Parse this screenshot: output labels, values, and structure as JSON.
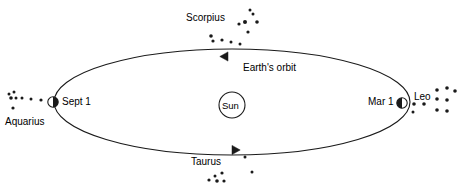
{
  "diagram": {
    "background_color": "#ffffff",
    "stroke_color": "#1a1a1a",
    "text_color": "#000000",
    "width": 466,
    "height": 191
  },
  "orbit": {
    "label": "Earth's orbit",
    "label_x": 243,
    "label_y": 63,
    "center_x": 232,
    "center_y": 102,
    "radius_x": 178,
    "radius_y": 53,
    "direction": "counterclockwise",
    "stroke_width": 1.1
  },
  "sun": {
    "label": "Sun",
    "center_x": 232,
    "center_y": 105,
    "radius": 13,
    "label_x": 222,
    "label_y": 101
  },
  "earth_positions": [
    {
      "name": "earth-sept-1",
      "date_label": "Sept 1",
      "marker_x": 53,
      "marker_y": 102,
      "marker_radius": 5.2,
      "label_x": 62,
      "label_y": 97,
      "lit_side": "right"
    },
    {
      "name": "earth-mar-1",
      "date_label": "Mar 1",
      "marker_x": 402,
      "marker_y": 103,
      "marker_radius": 5.2,
      "label_x": 368,
      "label_y": 97,
      "lit_side": "left"
    }
  ],
  "direction_arrows": [
    {
      "name": "arrow-top",
      "x": 228,
      "y": 56.5,
      "rotation": 180
    },
    {
      "name": "arrow-bottom",
      "x": 232,
      "y": 150,
      "rotation": 0
    }
  ],
  "constellations": [
    {
      "name": "scorpius",
      "label": "Scorpius",
      "label_x": 186,
      "label_y": 13,
      "stars": [
        {
          "x": 250,
          "y": 10,
          "r": 1.5
        },
        {
          "x": 253,
          "y": 14,
          "r": 1.5
        },
        {
          "x": 245,
          "y": 22,
          "r": 2.0
        },
        {
          "x": 257,
          "y": 22,
          "r": 1.8
        },
        {
          "x": 239,
          "y": 24,
          "r": 1.6
        },
        {
          "x": 248,
          "y": 32,
          "r": 1.6
        },
        {
          "x": 211,
          "y": 36,
          "r": 1.8
        },
        {
          "x": 213,
          "y": 41,
          "r": 1.6
        },
        {
          "x": 222,
          "y": 40,
          "r": 1.6
        },
        {
          "x": 231,
          "y": 42,
          "r": 1.5
        },
        {
          "x": 240,
          "y": 44,
          "r": 1.5
        }
      ]
    },
    {
      "name": "taurus",
      "label": "Taurus",
      "label_x": 191,
      "label_y": 157,
      "stars": [
        {
          "x": 245,
          "y": 157,
          "r": 1.5
        },
        {
          "x": 252,
          "y": 172,
          "r": 1.5
        },
        {
          "x": 215,
          "y": 176,
          "r": 1.5
        },
        {
          "x": 222,
          "y": 173,
          "r": 1.6
        },
        {
          "x": 209,
          "y": 180,
          "r": 1.6
        },
        {
          "x": 217,
          "y": 181,
          "r": 1.8
        },
        {
          "x": 224,
          "y": 181,
          "r": 1.6
        }
      ]
    },
    {
      "name": "leo",
      "label": "Leo",
      "label_x": 414,
      "label_y": 92,
      "stars": [
        {
          "x": 437,
          "y": 90,
          "r": 1.8
        },
        {
          "x": 447,
          "y": 88,
          "r": 1.8
        },
        {
          "x": 455,
          "y": 91,
          "r": 1.8
        },
        {
          "x": 437,
          "y": 99,
          "r": 1.8
        },
        {
          "x": 447,
          "y": 100,
          "r": 1.8
        },
        {
          "x": 414,
          "y": 104,
          "r": 1.8
        },
        {
          "x": 424,
          "y": 104,
          "r": 1.8
        },
        {
          "x": 437,
          "y": 110,
          "r": 1.8
        },
        {
          "x": 447,
          "y": 111,
          "r": 1.8
        },
        {
          "x": 413,
          "y": 112,
          "r": 1.5
        }
      ]
    },
    {
      "name": "aquarius",
      "label": "Aquarius",
      "label_x": 5,
      "label_y": 117,
      "stars": [
        {
          "x": 9,
          "y": 94,
          "r": 1.5
        },
        {
          "x": 14,
          "y": 92,
          "r": 1.5
        },
        {
          "x": 11,
          "y": 98,
          "r": 1.8
        },
        {
          "x": 16,
          "y": 98,
          "r": 1.5
        },
        {
          "x": 22,
          "y": 98,
          "r": 1.5
        },
        {
          "x": 31,
          "y": 99,
          "r": 1.5
        },
        {
          "x": 41,
          "y": 100,
          "r": 1.6
        },
        {
          "x": 13,
          "y": 108,
          "r": 1.6
        }
      ]
    }
  ]
}
